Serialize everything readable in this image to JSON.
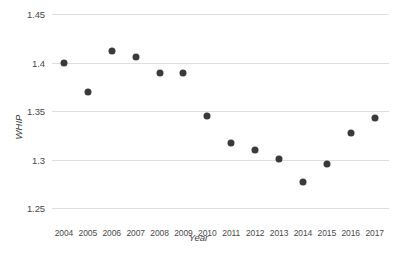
{
  "header": {
    "clipped_text": ""
  },
  "axes": {
    "ylabel": "WHIP",
    "xlabel": "Year",
    "yticks": [
      "1.45",
      "1.4",
      "1.35",
      "1.3",
      "1.25"
    ],
    "xticks": [
      "2004",
      "2005",
      "2006",
      "2007",
      "2008",
      "2009",
      "2010",
      "2011",
      "2012",
      "2013",
      "2014",
      "2015",
      "2016",
      "2017"
    ]
  },
  "style": {
    "point_color": "#3a3a3a",
    "grid_color": "#dedede",
    "text_color": "#4a4a4a",
    "background": "#ffffff"
  },
  "chart_data": {
    "type": "scatter",
    "title": "",
    "xlabel": "Year",
    "ylabel": "WHIP",
    "xlim": [
      2003.5,
      2017.6
    ],
    "ylim": [
      1.25,
      1.45
    ],
    "grid": true,
    "gridlines_y": [
      1.45,
      1.4,
      1.35,
      1.3,
      1.25
    ],
    "legend": null,
    "x": [
      2004,
      2005,
      2006,
      2007,
      2008,
      2009,
      2010,
      2011,
      2012,
      2013,
      2014,
      2015,
      2016,
      2017
    ],
    "values": [
      1.4,
      1.37,
      1.412,
      1.406,
      1.389,
      1.389,
      1.345,
      1.317,
      1.31,
      1.301,
      1.277,
      1.295,
      1.327,
      1.343
    ],
    "points": [
      {
        "x": 2004,
        "y": 1.4
      },
      {
        "x": 2005,
        "y": 1.37
      },
      {
        "x": 2006,
        "y": 1.412
      },
      {
        "x": 2007,
        "y": 1.406
      },
      {
        "x": 2008,
        "y": 1.389
      },
      {
        "x": 2009,
        "y": 1.389
      },
      {
        "x": 2010,
        "y": 1.345
      },
      {
        "x": 2011,
        "y": 1.317
      },
      {
        "x": 2012,
        "y": 1.31
      },
      {
        "x": 2013,
        "y": 1.301
      },
      {
        "x": 2014,
        "y": 1.277
      },
      {
        "x": 2015,
        "y": 1.295
      },
      {
        "x": 2016,
        "y": 1.327
      },
      {
        "x": 2017,
        "y": 1.343
      }
    ]
  }
}
